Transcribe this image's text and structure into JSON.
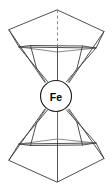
{
  "figure": {
    "title": "Pentagonal bipyramidal Fe coordination polyhedron",
    "center_label": "Fe",
    "background_color": "#ffffff",
    "edge_color": "#3c3c3c",
    "back_edge_color": "#6e6e6e",
    "bond_color": "#555555",
    "axis_color": "#8a8a8a",
    "center_outline_color": "#1d1d1d",
    "center_fill_color": "#ffffff",
    "width": 112,
    "height": 191
  },
  "geometry": {
    "center": {
      "x": 56,
      "y": 96,
      "radius": 15.5
    },
    "top_apex": {
      "x": 57.5,
      "y": 10
    },
    "bottom_apex": {
      "x": 57.5,
      "y": 182
    },
    "top_outer_pentagon": [
      {
        "x": 57.5,
        "y": 10
      },
      {
        "x": 104.0,
        "y": 31.5
      },
      {
        "x": 96.0,
        "y": 48.0
      },
      {
        "x": 19.0,
        "y": 47.0
      },
      {
        "x": 9.0,
        "y": 30.0
      }
    ],
    "top_inner_pentagon": [
      {
        "x": 30.5,
        "y": 45.5
      },
      {
        "x": 82.5,
        "y": 46.0
      },
      {
        "x": 96.0,
        "y": 48.0
      },
      {
        "x": 57.5,
        "y": 52.0
      },
      {
        "x": 19.0,
        "y": 47.0
      }
    ],
    "bottom_outer_pentagon": [
      {
        "x": 57.5,
        "y": 182
      },
      {
        "x": 104.0,
        "y": 158.5
      },
      {
        "x": 96.0,
        "y": 143.0
      },
      {
        "x": 19.0,
        "y": 144.0
      },
      {
        "x": 9.0,
        "y": 160.0
      }
    ],
    "bottom_inner_pentagon": [
      {
        "x": 30.5,
        "y": 145.5
      },
      {
        "x": 82.5,
        "y": 145.0
      },
      {
        "x": 96.0,
        "y": 143.0
      },
      {
        "x": 57.5,
        "y": 139.0
      },
      {
        "x": 19.0,
        "y": 144.0
      }
    ],
    "axis_dashed_segment": {
      "x": 57.5,
      "y1": 10,
      "y2": 46
    },
    "axis_solid_upper": {
      "x": 57.5,
      "y1": 46,
      "y2": 80.5
    },
    "axis_solid_lower": {
      "x": 57.5,
      "y1": 111.5,
      "y2": 182
    }
  },
  "icons": {
    "center_atom": "fe-atom-icon"
  }
}
